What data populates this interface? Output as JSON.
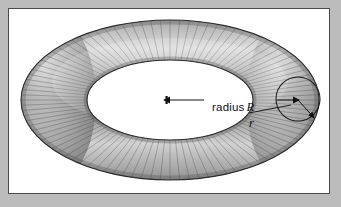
{
  "figure": {
    "kind": "torus-diagram",
    "caption_absent": true,
    "frame": {
      "background_color": "#bcbcbc",
      "panel_color": "#ffffff",
      "border_color": "#4a4a4a"
    },
    "labels": {
      "radius_major_prefix": "radius",
      "radius_major_symbol": "R",
      "radius_minor_symbol": "r"
    },
    "icons": {
      "major_radius_arrow": "arrow-left-icon",
      "minor_radius_arrow": "arrow-down-right-icon",
      "center_marker": "center-point-icon",
      "cross_section_circle": "circle-outline-icon"
    },
    "geometry": {
      "center_x": 161,
      "center_y": 91,
      "outer_rx": 149,
      "outer_ry": 80,
      "inner_rx": 83,
      "inner_ry": 40,
      "tube_circle_cx": 289,
      "tube_circle_cy": 90,
      "tube_circle_r": 22,
      "stripe_count": 96
    },
    "colors": {
      "torus_light": "#e2e2e2",
      "torus_mid": "#9a9a9a",
      "torus_dark": "#5c5c5c",
      "torus_outline": "#2c2c2c",
      "label_text": "#111111"
    }
  }
}
